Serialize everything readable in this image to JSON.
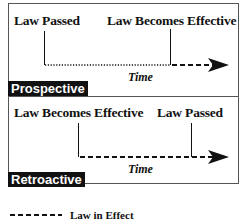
{
  "panels": [
    {
      "name": "Prospective",
      "label": "Prospective",
      "events": [
        {
          "label": "Law Passed",
          "order": 1
        },
        {
          "label": "Law Becomes Effective",
          "order": 2
        }
      ],
      "axis_label": "Time"
    },
    {
      "name": "Retroactive",
      "label": "Retroactive",
      "events": [
        {
          "label": "Law Becomes Effective",
          "order": 1
        },
        {
          "label": "Law Passed",
          "order": 2
        }
      ],
      "axis_label": "Time"
    }
  ],
  "legend": {
    "symbol": "dashed-line",
    "label": "Law in Effect"
  },
  "colors": {
    "line": "#111111",
    "tag_bg": "#111111",
    "tag_text": "#ffffff",
    "border": "#555555"
  }
}
